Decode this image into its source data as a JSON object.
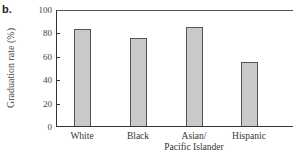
{
  "panel_label": "b.",
  "chart_data": {
    "type": "bar",
    "title": "",
    "xlabel": "",
    "ylabel": "Graduation rate (%)",
    "ylim": [
      0,
      100
    ],
    "yticks": [
      0,
      20,
      40,
      60,
      80,
      100
    ],
    "grid": false,
    "categories": [
      "White",
      "Black",
      "Asian/\nPacific Islander",
      "Hispanic"
    ],
    "category_lines": [
      [
        "White"
      ],
      [
        "Black"
      ],
      [
        "Asian/",
        "Pacific Islander"
      ],
      [
        "Hispanic"
      ]
    ],
    "values": [
      83,
      75,
      85,
      55
    ],
    "bar_color": "#c9c9c9",
    "bar_edge_color": "#555555"
  }
}
